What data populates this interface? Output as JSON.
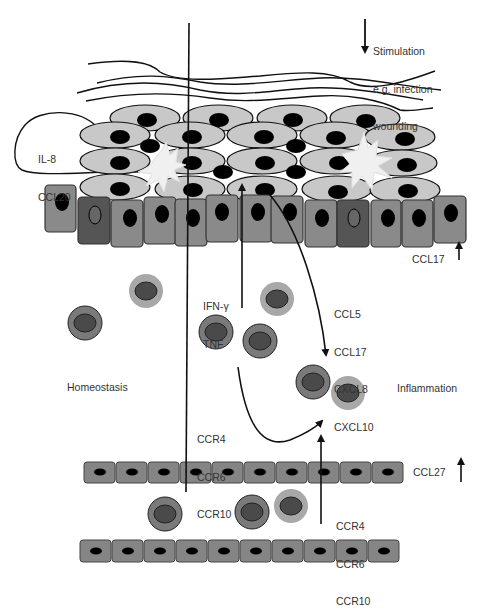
{
  "diagram": {
    "type": "skin immune cell trafficking schematic",
    "colors": {
      "keratinocyte_fill": "#c8c8c8",
      "nucleus": "#000000",
      "basal_cell_fill": "#8a8a8a",
      "basal_cell_dark": "#555555",
      "endothelial_fill": "#858585",
      "lymphocyte_outer_dark": "#7a7a7a",
      "lymphocyte_outer_light": "#a8a8a8",
      "lymphocyte_inner": "#4a4a4a",
      "dendritic_cell": "#f0f0f0",
      "line": "#111111",
      "text": "#333333"
    },
    "stimulation": {
      "lines": [
        "Stimulation",
        "e.g. infection",
        "wounding"
      ]
    },
    "epidermis_chemokines": {
      "lines": [
        "IL-8",
        "CCL20"
      ]
    },
    "basal_chemokine": {
      "label": "CCL17",
      "arrow": "up"
    },
    "cytokines": {
      "lines": [
        "IFN-γ",
        "TNF"
      ]
    },
    "inflammatory_chemokines": {
      "lines": [
        "CCL5",
        "CCL17",
        "CXCL8",
        "CXCL10"
      ]
    },
    "left_region": {
      "label": "Homeostasis"
    },
    "right_region": {
      "label": "Inflammation"
    },
    "receptors_upper": {
      "lines": [
        "CCR4",
        "CCR6",
        "CCR10"
      ]
    },
    "vessel_chemokine": {
      "label": "CCL27",
      "arrow": "up"
    },
    "receptors_lower": {
      "lines": [
        "CCR4",
        "CCR6",
        "CCR10"
      ]
    }
  }
}
